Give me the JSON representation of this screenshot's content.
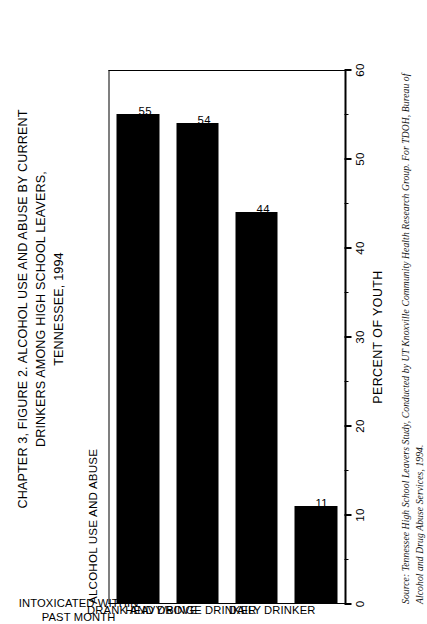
{
  "figure": {
    "title_lines": [
      "CHAPTER 3, FIGURE 2. ALCOHOL USE AND ABUSE BY CURRENT",
      "DRINKERS AMONG HIGH SCHOOL LEAVERS,",
      "TENNESSEE, 1994"
    ],
    "category_axis_title": "ALCOHOL USE AND ABUSE",
    "source_lines": [
      "Source: Tennessee High School Leavers Study, Conducted by UT Knoxville Community Health Research Group. For TDOH, Bureau of",
      "Alcohol and Drug Abuse Services, 1994."
    ]
  },
  "chart_data": {
    "type": "bar",
    "orientation": "vertical",
    "title": "CHAPTER 3, FIGURE 2. ALCOHOL USE AND ABUSE BY CURRENT DRINKERS AMONG HIGH SCHOOL LEAVERS, TENNESSEE, 1994",
    "xlabel": "ALCOHOL USE AND ABUSE",
    "ylabel": "PERCENT OF YOUTH",
    "ylim": [
      0,
      60
    ],
    "ytick_step": 10,
    "yminor_step": 5,
    "grid": false,
    "legend": false,
    "bar_color": "#000000",
    "categories": [
      "INTOXICATED WITHIN PAST MONTH",
      "DRANK AND DROVE",
      "HEAVY/BINGE DRINKER",
      "DAILY DRINKER"
    ],
    "category_label_lines": [
      [
        "INTOXICATED WITHIN",
        "PAST MONTH"
      ],
      [
        "DRANK AND DROVE"
      ],
      [
        "HEAVY/BINGE DRINKER"
      ],
      [
        "DAILY DRINKER"
      ]
    ],
    "values": [
      55,
      54,
      44,
      11
    ],
    "value_labels": [
      "55",
      "54",
      "44",
      "11"
    ],
    "ytick_labels": [
      "0",
      "10",
      "20",
      "30",
      "40",
      "50",
      "60"
    ],
    "ytick_values": [
      0,
      10,
      20,
      30,
      40,
      50,
      60
    ],
    "yminor_values": [
      5,
      15,
      25,
      35,
      45,
      55
    ]
  }
}
